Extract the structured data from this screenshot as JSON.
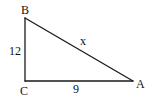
{
  "diagram": {
    "type": "right-triangle",
    "vertices": {
      "B": {
        "label": "B",
        "x": 25,
        "y": 18
      },
      "C": {
        "label": "C",
        "x": 25,
        "y": 81
      },
      "A": {
        "label": "A",
        "x": 133,
        "y": 81
      }
    },
    "sides": {
      "BC": {
        "label": "12"
      },
      "CA": {
        "label": "9"
      },
      "BA": {
        "label": "x"
      }
    },
    "colors": {
      "stroke": "#1a1a1a",
      "text": "#111111",
      "background": "#ffffff"
    }
  }
}
